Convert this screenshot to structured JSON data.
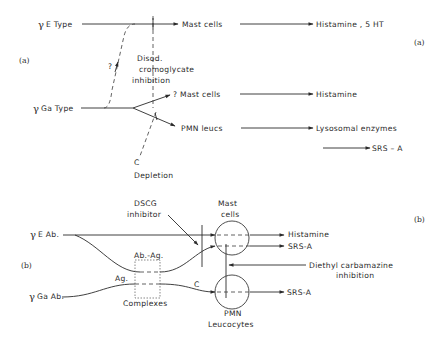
{
  "figure": {
    "part_a": {
      "label_left": "(a)",
      "label_right": "(a)",
      "ige_type": {
        "symbol": "γ",
        "label": "E Type"
      },
      "igga_type": {
        "symbol": "γ",
        "label": "Ga Type"
      },
      "question_mark": "?",
      "inhibition_label": [
        "Disod.",
        "cromoglycate",
        "inhibition"
      ],
      "depletion_label": [
        "C",
        "Depletion"
      ],
      "targets": [
        {
          "cell": "Mast  cells",
          "product": "Histamine , 5 HT"
        },
        {
          "cell": "? Mast  cells",
          "product": "Histamine"
        },
        {
          "cell": "PMN  leucs",
          "product": "Lysosomal  enzymes"
        }
      ],
      "extra_product": "SRS  –  A"
    },
    "part_b": {
      "label_left": "(b)",
      "label_right": "(b)",
      "ige_ab": {
        "symbol": "γ",
        "label": "E Ab."
      },
      "igga_ab": {
        "symbol": "γ",
        "label": "Ga Ab."
      },
      "dscg_label": [
        "DSCG",
        "inhibitor"
      ],
      "mast_cells_label": [
        "Mast",
        "cells"
      ],
      "pmn_label": [
        "PMN",
        "Leucocytes"
      ],
      "ab_ag_label": "Ab.-Ag.",
      "ag_label": "Ag.",
      "complexes_label": "Complexes",
      "c_label": "C",
      "mast_products": [
        "Histamine",
        "SRS-A"
      ],
      "pmn_product": "SRS-A",
      "dec_label": [
        "Diethyl  carbamazine",
        "inhibition"
      ]
    }
  }
}
